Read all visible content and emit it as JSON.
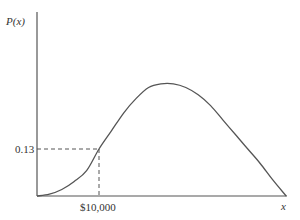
{
  "chart_data": {
    "type": "line",
    "title": "",
    "xlabel": "x",
    "ylabel": "P(x)",
    "grid": false,
    "legend": null,
    "x_unit": "thousands of dollars (inferred scale from $10,000 tick)",
    "x": [
      0,
      2,
      4,
      6,
      8,
      10,
      12,
      14,
      16,
      18,
      20,
      22,
      24,
      26,
      28,
      30,
      32,
      34,
      36,
      38,
      40.2
    ],
    "y": [
      0.0,
      0.005,
      0.018,
      0.04,
      0.07,
      0.13,
      0.18,
      0.23,
      0.27,
      0.3,
      0.31,
      0.31,
      0.3,
      0.28,
      0.25,
      0.21,
      0.17,
      0.13,
      0.09,
      0.045,
      0.0
    ],
    "annotations": [
      {
        "type": "dashed-guide",
        "x_label": "$10,000",
        "y_label": "0.13",
        "x": 10,
        "y": 0.13
      }
    ],
    "xticks": [
      "$10,000"
    ],
    "yticks": [
      "0.13"
    ],
    "ylim": [
      0,
      0.36
    ],
    "xlim": [
      0,
      42
    ],
    "stroke_color": "#555555",
    "axis_color": "#555555"
  },
  "labels": {
    "y_axis": "P(x)",
    "x_axis": "x",
    "y_tick": "0.13",
    "x_tick": "$10,000"
  }
}
